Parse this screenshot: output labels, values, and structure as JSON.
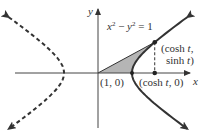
{
  "diagram": {
    "type": "hyperbola-parametrization",
    "equation": {
      "lhs_x": "x",
      "exp": "2",
      "minus": " − ",
      "lhs_y": "y",
      "rhs": " = 1"
    },
    "axes": {
      "x_label": "x",
      "y_label": "y"
    },
    "point_on_curve": {
      "line1_a": "(cosh ",
      "line1_t": "t",
      "line1_b": ",",
      "line2_a": "sinh ",
      "line2_t": "t",
      "line2_b": ")"
    },
    "point_on_axis": {
      "a": "(cosh ",
      "t": "t",
      "b": ", 0)"
    },
    "vertex_label": "(1, 0)",
    "parameter_t": 1.1,
    "right_branch_style": "solid",
    "left_branch_style": "dashed",
    "shaded_region": "sector from origin to (1,0) to (cosh t, sinh t)",
    "colors": {
      "curve": "#333333",
      "axis": "#444444",
      "shade": "#b5b5b5"
    }
  }
}
